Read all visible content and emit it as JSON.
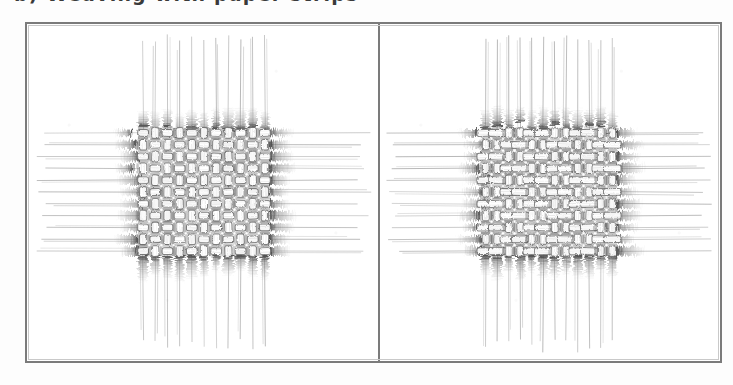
{
  "page": {
    "background_color": "#fdfdfd",
    "width": 733,
    "height": 385
  },
  "caption": {
    "text": "b) Weaving with paper strips",
    "note": "top line of caption text is cropped off at the top edge of the screenshot; only the lower fragments of a few glyphs are visible"
  },
  "frame": {
    "border_color": "#7b7b7b",
    "inner_border_color": "#c9c9c9",
    "divider_color": "#7b7b7b",
    "fill_color": "#ffffff"
  },
  "figure": {
    "kind": "textile-weave-diagram-pair",
    "ink_color": "#6f6f6f",
    "fringe_color": "#595959",
    "thread_color": "#9a9a9a",
    "panels": [
      {
        "id": "panel-left",
        "label": "left-weave-panel",
        "weave_type": "plain weave",
        "description": "Square checkerboard plain weave (1/1) with equal warp and weft floats; loose warp threads run vertically above and below the woven block, loose weft threads run horizontally to the left and right, all ending in dark frayed fringes at the edge of the fabric.",
        "grid": {
          "columns": 11,
          "rows": 11,
          "cell_width": 12.2,
          "cell_height": 11.8
        },
        "block": {
          "x": 110,
          "y": 103,
          "width": 134,
          "height": 130
        },
        "warp_count": 11,
        "weft_count": 11,
        "intersection_dots": true
      },
      {
        "id": "panel-right",
        "label": "right-weave-panel",
        "weave_type": "rib / basket weave",
        "description": "Weave with elongated horizontal weft floats spanning two warp ends, giving wide rectangular cells; same loose warp threads above and below and loose weft threads left and right, with dark frayed fringes at the fabric edges.",
        "grid": {
          "columns": 12,
          "rows": 11,
          "cell_width": 11.5,
          "cell_height": 11.8
        },
        "block": {
          "x": 100,
          "y": 103,
          "width": 138,
          "height": 130
        },
        "warp_count": 12,
        "weft_count": 11,
        "intersection_dots": true
      }
    ]
  }
}
